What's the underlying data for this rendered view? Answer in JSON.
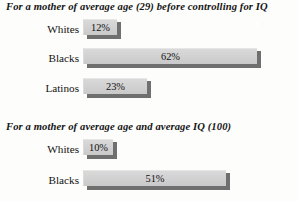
{
  "chart_data": {
    "type": "bar",
    "orientation": "horizontal",
    "title": "",
    "xlabel": "",
    "ylabel": "",
    "xlim": [
      0,
      70
    ],
    "grid": false,
    "legend": "none",
    "panels": [
      {
        "title": "For a mother of average age (29) before controlling for IQ",
        "categories": [
          "Whites",
          "Blacks",
          "Latinos"
        ],
        "values": [
          12,
          23,
          62
        ],
        "bars": [
          {
            "label": "Whites",
            "value": 12,
            "value_label": "12%"
          },
          {
            "label": "Blacks",
            "value": 62,
            "value_label": "62%"
          },
          {
            "label": "Latinos",
            "value": 23,
            "value_label": "23%"
          }
        ]
      },
      {
        "title": "For a mother of average age and average IQ  (100)",
        "categories": [
          "Whites",
          "Blacks"
        ],
        "values": [
          10,
          51
        ],
        "bars": [
          {
            "label": "Whites",
            "value": 10,
            "value_label": "10%"
          },
          {
            "label": "Blacks",
            "value": 51,
            "value_label": "51%"
          }
        ]
      }
    ]
  },
  "colors": {
    "bar_fill": "#d2d2d2",
    "bar_shadow": "#6f6f6f",
    "text": "#121212",
    "background": "#fdfdfc"
  }
}
